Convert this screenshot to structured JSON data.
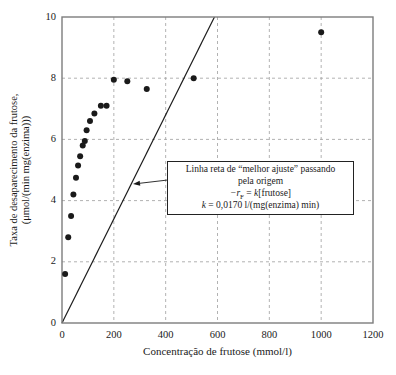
{
  "chart_data": {
    "type": "scatter",
    "title": "",
    "xlabel": "Concentração de frutose (mmol/l)",
    "ylabel": [
      "Taxa de desaparecimento da frutose,",
      "(μmol/(min mg(enzima)))"
    ],
    "xlim": [
      0,
      1200
    ],
    "ylim": [
      0,
      10
    ],
    "xticks": [
      0,
      200,
      400,
      600,
      800,
      1000,
      1200
    ],
    "yticks": [
      0,
      2,
      4,
      6,
      8,
      10
    ],
    "grid": "dashed",
    "legend": "none",
    "points": [
      [
        12,
        1.6
      ],
      [
        24,
        2.8
      ],
      [
        35,
        3.5
      ],
      [
        44,
        4.2
      ],
      [
        54,
        4.75
      ],
      [
        62,
        5.15
      ],
      [
        70,
        5.45
      ],
      [
        80,
        5.8
      ],
      [
        88,
        5.95
      ],
      [
        95,
        6.3
      ],
      [
        108,
        6.6
      ],
      [
        125,
        6.85
      ],
      [
        150,
        7.1
      ],
      [
        172,
        7.1
      ],
      [
        200,
        7.95
      ],
      [
        252,
        7.9
      ],
      [
        327,
        7.65
      ],
      [
        508,
        8.0
      ],
      [
        1000,
        9.5
      ]
    ],
    "fit_line": {
      "k": 0.017,
      "through_origin": true
    },
    "colors": {
      "point": "#1a1a1a",
      "line": "#1a1a1a",
      "grid": "#a9a9a9",
      "frame": "#7d7d7d",
      "text": "#1a1a1a"
    }
  },
  "annotation": {
    "line1": "Linha reta de “melhor ajuste” passando",
    "line2": "pela origem",
    "eq": {
      "neg_r": "−r",
      "sub": "F",
      "equals": " = ",
      "k": "k",
      "bracket": "[frutose]"
    },
    "kline": {
      "k": "k",
      "rest": " = 0,0170 l/(mg(enzima) min)"
    },
    "arrow": {
      "tail": [
        405,
        4.67
      ],
      "tip": [
        274,
        4.54
      ]
    }
  }
}
